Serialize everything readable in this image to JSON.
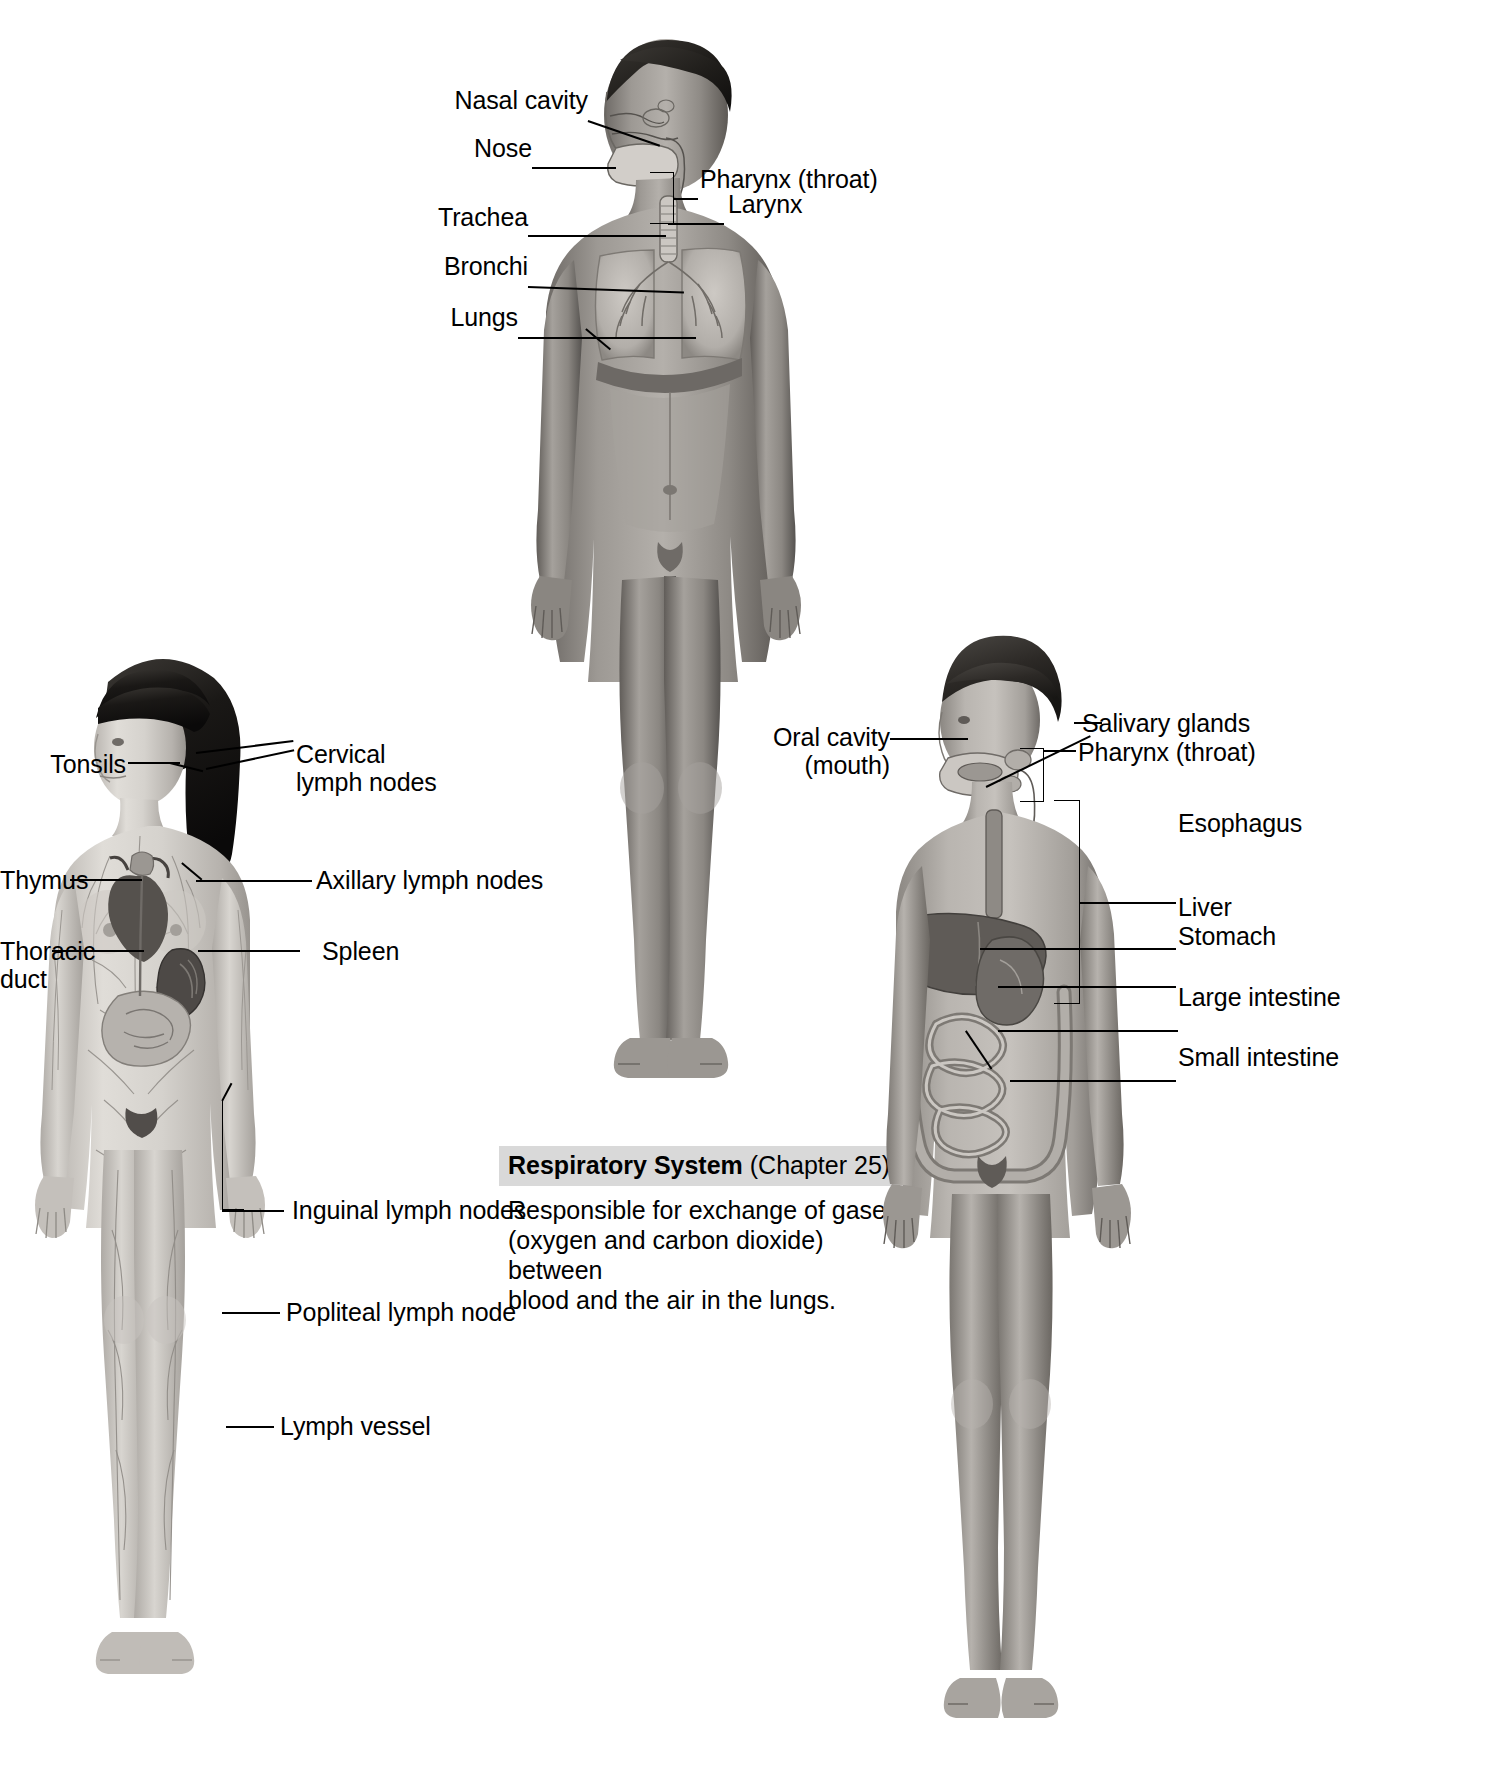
{
  "figures": {
    "lymphatic": {
      "name": "Lymphatic system figure",
      "subject": "female-body-anterior",
      "labels": [
        {
          "id": "tonsils",
          "text": "Tonsils"
        },
        {
          "id": "cervical-lymph-nodes",
          "text": "Cervical\nlymph nodes"
        },
        {
          "id": "thymus",
          "text": "Thymus"
        },
        {
          "id": "axillary-lymph-nodes",
          "text": "Axillary lymph nodes"
        },
        {
          "id": "thoracic-duct",
          "text": "Thoracic\nduct"
        },
        {
          "id": "spleen",
          "text": "Spleen"
        },
        {
          "id": "inguinal-lymph-nodes",
          "text": "Inguinal lymph nodes"
        },
        {
          "id": "popliteal-lymph-node",
          "text": "Popliteal lymph node"
        },
        {
          "id": "lymph-vessel",
          "text": "Lymph vessel"
        }
      ]
    },
    "respiratory": {
      "name": "Respiratory system figure",
      "subject": "male-body-anterior",
      "labels": [
        {
          "id": "nasal-cavity",
          "text": "Nasal cavity"
        },
        {
          "id": "nose",
          "text": "Nose"
        },
        {
          "id": "pharynx",
          "text": "Pharynx (throat)"
        },
        {
          "id": "larynx",
          "text": "Larynx"
        },
        {
          "id": "trachea",
          "text": "Trachea"
        },
        {
          "id": "bronchi",
          "text": "Bronchi"
        },
        {
          "id": "lungs",
          "text": "Lungs"
        }
      ],
      "caption": {
        "title": "Respiratory System",
        "chapter": "(Chapter 25)",
        "body": "Responsible for exchange of gases\n(oxygen and carbon dioxide) between\nblood and the air in the lungs.",
        "banner_color": "#d9d9d9"
      }
    },
    "digestive": {
      "name": "Digestive system figure",
      "subject": "male-body-anterior",
      "labels": [
        {
          "id": "oral-cavity",
          "text": "Oral cavity\n(mouth)"
        },
        {
          "id": "salivary-glands",
          "text": "Salivary glands"
        },
        {
          "id": "pharynx",
          "text": "Pharynx (throat)"
        },
        {
          "id": "esophagus",
          "text": "Esophagus"
        },
        {
          "id": "liver",
          "text": "Liver"
        },
        {
          "id": "stomach",
          "text": "Stomach"
        },
        {
          "id": "large-intestine",
          "text": "Large intestine"
        },
        {
          "id": "small-intestine",
          "text": "Small intestine"
        }
      ]
    }
  },
  "colors": {
    "background": "#ffffff",
    "text": "#000000",
    "leader_line": "#000000",
    "banner": "#d9d9d9",
    "skin_light": "#c9c6c1",
    "skin_mid": "#a39f99",
    "skin_dark": "#7b7772",
    "organ_dark": "#5f5b57",
    "hair_dark": "#2a2724"
  }
}
